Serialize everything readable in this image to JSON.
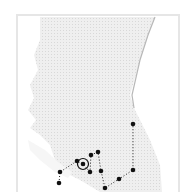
{
  "map": {
    "region": "British Columbia",
    "colors": {
      "land": "#ececec",
      "land_pattern": "#dcdcdc",
      "water": "#ffffff",
      "frame": "#e6e6e6",
      "marker": "#111111",
      "route": "#222222",
      "border_line": "#bdbdbd"
    },
    "route": {
      "style": "dotted",
      "points": [
        {
          "x": 60,
          "y": 172
        },
        {
          "x": 59,
          "y": 183
        }
      ],
      "path": [
        [
          77,
          161
        ],
        [
          83,
          164
        ],
        [
          70,
          175
        ]
      ]
    },
    "markers": [
      {
        "id": "m1",
        "x": 133,
        "y": 124,
        "type": "dot"
      },
      {
        "id": "m2",
        "x": 133,
        "y": 170,
        "type": "dot"
      },
      {
        "id": "m3",
        "x": 119,
        "y": 179,
        "type": "dot"
      },
      {
        "id": "m4",
        "x": 105,
        "y": 188,
        "type": "dot"
      },
      {
        "id": "m5",
        "x": 101,
        "y": 171,
        "type": "dot"
      },
      {
        "id": "m6",
        "x": 98,
        "y": 152,
        "type": "dot"
      },
      {
        "id": "m7",
        "x": 91,
        "y": 155,
        "type": "dot"
      },
      {
        "id": "m8",
        "x": 90,
        "y": 172,
        "type": "dot"
      },
      {
        "id": "m9",
        "x": 83,
        "y": 164,
        "type": "circled"
      },
      {
        "id": "m10",
        "x": 77,
        "y": 161,
        "type": "dot"
      },
      {
        "id": "m11",
        "x": 60,
        "y": 172,
        "type": "dot"
      },
      {
        "id": "m12",
        "x": 59,
        "y": 183,
        "type": "dot"
      }
    ]
  }
}
